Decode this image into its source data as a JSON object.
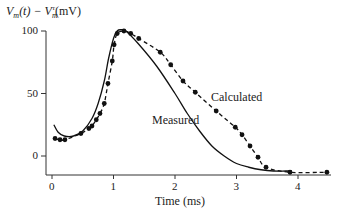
{
  "chart_data": {
    "type": "line",
    "title": "",
    "xlabel": "Time (ms)",
    "ylabel": "V_m(t) − V_m^r (mV)",
    "ylabel_display": {
      "main": "V",
      "sub1": "m",
      "mid": "(t) − V",
      "sub2": "m",
      "sup": "r",
      "unit": "(mV)"
    },
    "xlim": [
      0,
      4.5
    ],
    "ylim": [
      -15,
      105
    ],
    "x_ticks": [
      0,
      1,
      2,
      3,
      4
    ],
    "y_ticks": [
      0,
      50,
      100
    ],
    "x_tick_labels": [
      "0",
      "1",
      "2",
      "3",
      "4"
    ],
    "y_tick_labels": [
      "0",
      "50",
      "100"
    ],
    "grid": false,
    "legend": "inline annotations",
    "series": [
      {
        "name": "Measured",
        "style": "solid",
        "x": [
          0.03,
          0.1,
          0.2,
          0.35,
          0.5,
          0.65,
          0.75,
          0.85,
          0.92,
          1.0,
          1.06,
          1.12,
          1.2,
          1.4,
          1.7,
          2.0,
          2.2,
          2.4,
          2.6,
          2.8,
          3.0,
          3.2,
          3.4,
          3.6,
          3.8,
          3.9
        ],
        "values": [
          25,
          19,
          16,
          16,
          20,
          30,
          42,
          60,
          78,
          94,
          100,
          101,
          100,
          90,
          72,
          50,
          34,
          20,
          8,
          0,
          -6,
          -9,
          -11,
          -12,
          -12,
          -12
        ]
      },
      {
        "name": "Calculated",
        "style": "dashed with dots",
        "x": [
          0.05,
          0.13,
          0.21,
          0.47,
          0.6,
          0.65,
          0.72,
          0.78,
          0.85,
          0.91,
          0.98,
          1.01,
          1.06,
          1.17,
          1.28,
          1.41,
          1.76,
          1.93,
          2.13,
          2.33,
          2.67,
          2.98,
          3.09,
          3.22,
          3.35,
          3.48,
          3.87,
          4.47
        ],
        "values": [
          14,
          13,
          13,
          18,
          22,
          24,
          29,
          34,
          42,
          58,
          76,
          89,
          98,
          100,
          98,
          94,
          83,
          73,
          60,
          51,
          36,
          23,
          17,
          8,
          -1,
          -9,
          -13,
          -13
        ]
      }
    ],
    "annotations": [
      {
        "text": "Calculated",
        "x": 2.6,
        "y": 47
      },
      {
        "text": "Measured",
        "x": 1.6,
        "y": 29
      }
    ]
  },
  "labels": {
    "xlabel": "Time (ms)",
    "calculated": "Calculated",
    "measured": "Measured"
  }
}
